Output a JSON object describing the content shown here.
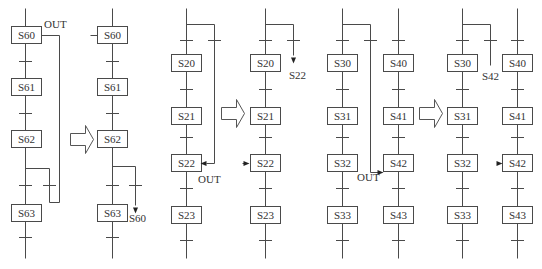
{
  "colors": {
    "line": "#4a4a4a",
    "text": "#333333",
    "background": "#ffffff"
  },
  "steps": [
    {
      "id": "p1-s60",
      "label": "S60",
      "x": 11,
      "y": 26
    },
    {
      "id": "p1-s61",
      "label": "S61",
      "x": 11,
      "y": 78
    },
    {
      "id": "p1-s62",
      "label": "S62",
      "x": 11,
      "y": 130
    },
    {
      "id": "p1-s63",
      "label": "S63",
      "x": 11,
      "y": 204
    },
    {
      "id": "p2-s60",
      "label": "S60",
      "x": 97,
      "y": 26
    },
    {
      "id": "p2-s61",
      "label": "S61",
      "x": 97,
      "y": 78
    },
    {
      "id": "p2-s62",
      "label": "S62",
      "x": 97,
      "y": 130
    },
    {
      "id": "p2-s63",
      "label": "S63",
      "x": 97,
      "y": 204
    },
    {
      "id": "p3-s20",
      "label": "S20",
      "x": 171,
      "y": 54
    },
    {
      "id": "p3-s21",
      "label": "S21",
      "x": 171,
      "y": 107
    },
    {
      "id": "p3-s22",
      "label": "S22",
      "x": 171,
      "y": 154
    },
    {
      "id": "p3-s23",
      "label": "S23",
      "x": 171,
      "y": 206
    },
    {
      "id": "p4-s20",
      "label": "S20",
      "x": 250,
      "y": 54
    },
    {
      "id": "p4-s21",
      "label": "S21",
      "x": 250,
      "y": 107
    },
    {
      "id": "p4-s22",
      "label": "S22",
      "x": 250,
      "y": 154
    },
    {
      "id": "p4-s23",
      "label": "S23",
      "x": 250,
      "y": 206
    },
    {
      "id": "p5-s30",
      "label": "S30",
      "x": 327,
      "y": 54
    },
    {
      "id": "p5-s31",
      "label": "S31",
      "x": 327,
      "y": 107
    },
    {
      "id": "p5-s32",
      "label": "S32",
      "x": 327,
      "y": 154
    },
    {
      "id": "p5-s33",
      "label": "S33",
      "x": 327,
      "y": 206
    },
    {
      "id": "p6-s40",
      "label": "S40",
      "x": 383,
      "y": 54
    },
    {
      "id": "p6-s41",
      "label": "S41",
      "x": 383,
      "y": 107
    },
    {
      "id": "p6-s42",
      "label": "S42",
      "x": 383,
      "y": 154
    },
    {
      "id": "p6-s43",
      "label": "S43",
      "x": 383,
      "y": 206
    },
    {
      "id": "p7-s30",
      "label": "S30",
      "x": 447,
      "y": 54
    },
    {
      "id": "p7-s31",
      "label": "S31",
      "x": 447,
      "y": 107
    },
    {
      "id": "p7-s32",
      "label": "S32",
      "x": 447,
      "y": 154
    },
    {
      "id": "p7-s33",
      "label": "S33",
      "x": 447,
      "y": 206
    },
    {
      "id": "p8-s40",
      "label": "S40",
      "x": 502,
      "y": 54
    },
    {
      "id": "p8-s41",
      "label": "S41",
      "x": 502,
      "y": 107
    },
    {
      "id": "p8-s42",
      "label": "S42",
      "x": 502,
      "y": 154
    },
    {
      "id": "p8-s43",
      "label": "S43",
      "x": 502,
      "y": 206
    }
  ],
  "step_box": {
    "w": 30,
    "h": 17
  },
  "lines": [
    [
      25,
      8,
      25,
      26
    ],
    [
      25,
      43,
      25,
      78
    ],
    [
      25,
      95,
      25,
      130
    ],
    [
      25,
      147,
      25,
      204
    ],
    [
      25,
      221,
      25,
      258
    ],
    [
      41,
      35,
      59,
      35
    ],
    [
      59,
      35,
      59,
      202
    ],
    [
      59,
      202,
      49,
      202
    ],
    [
      49,
      202,
      49,
      168
    ],
    [
      49,
      168,
      25,
      168
    ],
    [
      112,
      8,
      112,
      26
    ],
    [
      112,
      43,
      112,
      78
    ],
    [
      112,
      95,
      112,
      130
    ],
    [
      112,
      147,
      112,
      204
    ],
    [
      112,
      221,
      112,
      258
    ],
    [
      90,
      35,
      97,
      35
    ],
    [
      112,
      166,
      135,
      166
    ],
    [
      135,
      166,
      135,
      205
    ],
    [
      186,
      8,
      186,
      54
    ],
    [
      186,
      71,
      186,
      107
    ],
    [
      186,
      124,
      186,
      154
    ],
    [
      186,
      171,
      186,
      206
    ],
    [
      186,
      223,
      186,
      258
    ],
    [
      186,
      24,
      214,
      24
    ],
    [
      214,
      24,
      214,
      163
    ],
    [
      214,
      163,
      206,
      163
    ],
    [
      265,
      8,
      265,
      54
    ],
    [
      265,
      71,
      265,
      107
    ],
    [
      265,
      124,
      265,
      154
    ],
    [
      265,
      171,
      265,
      206
    ],
    [
      265,
      223,
      265,
      258
    ],
    [
      265,
      24,
      293,
      24
    ],
    [
      293,
      24,
      293,
      55
    ],
    [
      242,
      163,
      246,
      163
    ],
    [
      342,
      8,
      342,
      54
    ],
    [
      342,
      71,
      342,
      107
    ],
    [
      342,
      124,
      342,
      154
    ],
    [
      342,
      171,
      342,
      206
    ],
    [
      342,
      223,
      342,
      258
    ],
    [
      342,
      24,
      370,
      24
    ],
    [
      370,
      24,
      370,
      172
    ],
    [
      370,
      172,
      378,
      172
    ],
    [
      398,
      8,
      398,
      54
    ],
    [
      398,
      71,
      398,
      107
    ],
    [
      398,
      124,
      398,
      154
    ],
    [
      398,
      171,
      398,
      206
    ],
    [
      398,
      223,
      398,
      258
    ],
    [
      462,
      8,
      462,
      54
    ],
    [
      462,
      71,
      462,
      107
    ],
    [
      462,
      124,
      462,
      154
    ],
    [
      462,
      171,
      462,
      206
    ],
    [
      462,
      223,
      462,
      258
    ],
    [
      462,
      24,
      490,
      24
    ],
    [
      490,
      24,
      490,
      65
    ],
    [
      517,
      8,
      517,
      54
    ],
    [
      517,
      71,
      517,
      107
    ],
    [
      517,
      124,
      517,
      154
    ],
    [
      517,
      171,
      517,
      206
    ],
    [
      517,
      223,
      517,
      258
    ]
  ],
  "ticks": [
    [
      25,
      61
    ],
    [
      25,
      113
    ],
    [
      25,
      185
    ],
    [
      25,
      237
    ],
    [
      49,
      185
    ],
    [
      112,
      61
    ],
    [
      112,
      113
    ],
    [
      112,
      185
    ],
    [
      112,
      237
    ],
    [
      135,
      185
    ],
    [
      186,
      40
    ],
    [
      186,
      89
    ],
    [
      186,
      137
    ],
    [
      186,
      188
    ],
    [
      186,
      240
    ],
    [
      214,
      40
    ],
    [
      265,
      40
    ],
    [
      265,
      89
    ],
    [
      265,
      137
    ],
    [
      265,
      188
    ],
    [
      265,
      240
    ],
    [
      293,
      40
    ],
    [
      342,
      40
    ],
    [
      342,
      89
    ],
    [
      342,
      137
    ],
    [
      342,
      188
    ],
    [
      342,
      240
    ],
    [
      370,
      40
    ],
    [
      398,
      40
    ],
    [
      398,
      89
    ],
    [
      398,
      137
    ],
    [
      398,
      188
    ],
    [
      398,
      240
    ],
    [
      462,
      40
    ],
    [
      462,
      89
    ],
    [
      462,
      137
    ],
    [
      462,
      188
    ],
    [
      462,
      240
    ],
    [
      490,
      40
    ],
    [
      517,
      40
    ],
    [
      517,
      89
    ],
    [
      517,
      137
    ],
    [
      517,
      188
    ],
    [
      517,
      240
    ]
  ],
  "arrowheads": [
    {
      "x": 135,
      "y": 213,
      "dir": "down"
    },
    {
      "x": 293,
      "y": 63,
      "dir": "down"
    },
    {
      "x": 200,
      "y": 163,
      "dir": "left"
    },
    {
      "x": 249,
      "y": 163,
      "dir": "right"
    },
    {
      "x": 383,
      "y": 172,
      "dir": "right"
    },
    {
      "x": 502,
      "y": 163,
      "dir": "right"
    }
  ],
  "labels": [
    {
      "id": "out-1",
      "text": "OUT",
      "x": 44,
      "y": 28
    },
    {
      "id": "jump-s60",
      "text": "S60",
      "x": 129,
      "y": 222
    },
    {
      "id": "out-2",
      "text": "OUT",
      "x": 198,
      "y": 183
    },
    {
      "id": "jump-s22",
      "text": "S22",
      "x": 289,
      "y": 79
    },
    {
      "id": "out-3",
      "text": "OUT",
      "x": 357,
      "y": 181
    },
    {
      "id": "jump-s42",
      "text": "S42",
      "x": 482,
      "y": 80
    }
  ],
  "transform_arrows": [
    {
      "id": "arrow-1",
      "x": 70,
      "y": 125
    },
    {
      "id": "arrow-2",
      "x": 221,
      "y": 99
    },
    {
      "id": "arrow-3",
      "x": 419,
      "y": 99
    }
  ]
}
